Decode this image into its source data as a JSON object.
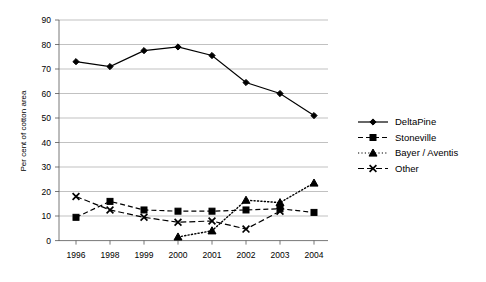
{
  "chart_data": {
    "type": "line",
    "title": "",
    "xlabel": "",
    "ylabel": "Per cent of cotton area",
    "categories": [
      "1996",
      "1998",
      "1999",
      "2000",
      "2001",
      "2002",
      "2003",
      "2004"
    ],
    "x": [
      1996,
      1998,
      1999,
      2000,
      2001,
      2002,
      2003,
      2004
    ],
    "ylim": [
      0,
      90
    ],
    "yticks": [
      0,
      10,
      20,
      30,
      40,
      50,
      60,
      70,
      80,
      90
    ],
    "ytick_labels": [
      "0",
      "10",
      "20",
      "30",
      "40",
      "50",
      "60",
      "70",
      "80",
      "90"
    ],
    "grid": "horizontal",
    "legend_position": "right",
    "series": [
      {
        "name": "DeltaPine",
        "marker": "diamond",
        "linestyle": "solid",
        "color": "#000000",
        "values": [
          73,
          71,
          77.5,
          79,
          75.5,
          64.5,
          60,
          51
        ]
      },
      {
        "name": "Stoneville",
        "marker": "square",
        "linestyle": "dashed",
        "color": "#000000",
        "values": [
          9.5,
          16,
          12.5,
          12,
          12,
          12.5,
          13,
          11.5
        ]
      },
      {
        "name": "Bayer / Aventis",
        "marker": "triangle",
        "linestyle": "dotted",
        "color": "#000000",
        "values": [
          null,
          null,
          null,
          1.5,
          4,
          16.5,
          15.5,
          23.5
        ]
      },
      {
        "name": "Other",
        "marker": "x",
        "linestyle": "dashdot",
        "color": "#000000",
        "values": [
          18,
          12.5,
          9.5,
          7.5,
          8,
          4.7,
          12,
          null
        ]
      }
    ]
  },
  "axis": {
    "y_title": "Per cent of cotton area",
    "y_labels": [
      "90",
      "80",
      "70",
      "60",
      "50",
      "40",
      "30",
      "20",
      "10",
      "0"
    ],
    "x_labels": [
      "1996",
      "1998",
      "1999",
      "2000",
      "2001",
      "2002",
      "2003",
      "2004"
    ]
  },
  "legend": {
    "items": [
      {
        "label": "DeltaPine",
        "marker": "diamond-marker-icon",
        "linestyle": "solid"
      },
      {
        "label": "Stoneville",
        "marker": "square-marker-icon",
        "linestyle": "dashed"
      },
      {
        "label": "Bayer / Aventis",
        "marker": "triangle-marker-icon",
        "linestyle": "dotted"
      },
      {
        "label": "Other",
        "marker": "x-marker-icon",
        "linestyle": "dashdot"
      }
    ]
  }
}
